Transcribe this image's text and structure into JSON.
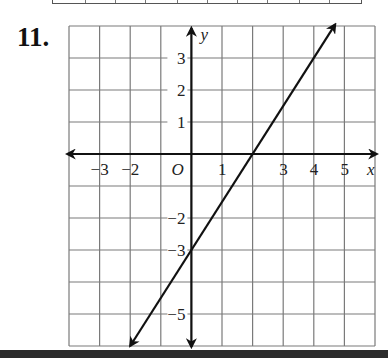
{
  "problem": {
    "number_label": "11."
  },
  "chart_data": {
    "type": "line",
    "title": "",
    "xlabel": "x",
    "ylabel": "y",
    "origin_label": "O",
    "xlim": [
      -4,
      6
    ],
    "ylim": [
      -6,
      4
    ],
    "grid": true,
    "x_tick_labels": [
      "−3",
      "−2",
      "1",
      "3",
      "4",
      "5"
    ],
    "x_tick_values": [
      -3,
      -2,
      1,
      3,
      4,
      5
    ],
    "y_tick_labels": [
      "3",
      "2",
      "1",
      "−2",
      "−3",
      "−5"
    ],
    "y_tick_values": [
      3,
      2,
      1,
      -2,
      -3,
      -5
    ],
    "series": [
      {
        "name": "line",
        "equation": "y = 1.5x - 3",
        "x": [
          -2,
          0,
          2,
          4.7
        ],
        "values": [
          -6,
          -3,
          0,
          4.05
        ],
        "arrows": "both"
      }
    ]
  },
  "colors": {
    "grid": "#7a7a7a",
    "axis": "#111111",
    "line": "#111111",
    "bottom_bar": "#2b2b2b"
  }
}
